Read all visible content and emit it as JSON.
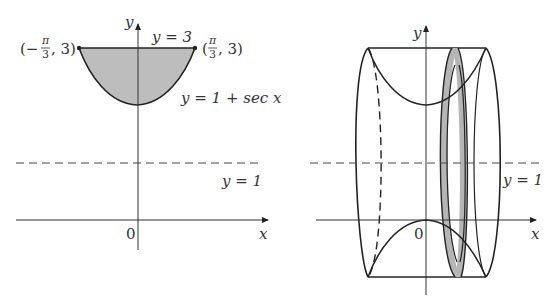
{
  "left_figure": {
    "y_axis_label": "y",
    "x_axis_label": "x",
    "origin_label": "0",
    "top_line_label": "y = 3",
    "curve_label": "y = 1 + sec x",
    "axis_line_label": "y = 1",
    "left_point": {
      "prefix": "(−",
      "num": "π",
      "den": "3",
      "suffix": ", 3)"
    },
    "right_point": {
      "prefix": "(",
      "num": "π",
      "den": "3",
      "suffix": ", 3)"
    }
  },
  "right_figure": {
    "y_axis_label": "y",
    "x_axis_label": "x",
    "origin_label": "0",
    "axis_line_label": "y = 1"
  },
  "colors": {
    "stroke": "#222222",
    "shade": "#b8b8b8",
    "dash": "#444444"
  }
}
